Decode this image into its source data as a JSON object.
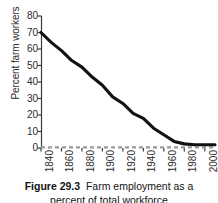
{
  "figure": {
    "caption_label": "Figure 29.3",
    "caption_text": "Farm employment as a",
    "caption_line2": "percent of total workforce"
  },
  "axes": {
    "ylabel": "Percent farm workers",
    "xlabel": "",
    "ytick_labels": [
      "80",
      "70",
      "60",
      "50",
      "40",
      "30",
      "20",
      "10",
      "0"
    ],
    "xtick_labels": [
      "1840",
      "1860",
      "1880",
      "1900",
      "1920",
      "1940",
      "1960",
      "1980",
      "2000"
    ]
  },
  "style": {
    "line_color": "#111111",
    "baseline_color": "#9a9a9a",
    "axis_color": "#3a3a3a",
    "background": "#ffffff"
  },
  "chart_data": {
    "type": "line",
    "xlabel": "",
    "ylabel": "Percent farm workers",
    "xlim": [
      1840,
      2010
    ],
    "ylim": [
      0,
      80
    ],
    "grid": false,
    "legend": "none",
    "x": [
      1840,
      1850,
      1860,
      1870,
      1880,
      1890,
      1900,
      1910,
      1920,
      1930,
      1940,
      1950,
      1960,
      1970,
      1980,
      1990,
      2000,
      2010
    ],
    "series": [
      {
        "name": "Percent farm workers",
        "values": [
          70,
          64,
          59,
          53,
          49,
          43,
          38,
          31,
          27,
          21,
          18,
          12,
          8,
          4,
          2.5,
          2,
          2,
          2
        ]
      }
    ],
    "annotations": [
      {
        "text": "baseline at 0",
        "y": 0,
        "style": "dashed-gray"
      }
    ]
  }
}
